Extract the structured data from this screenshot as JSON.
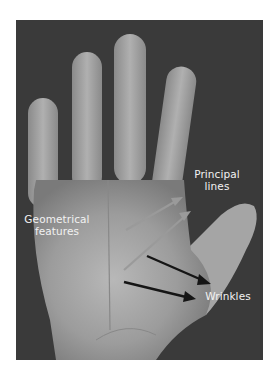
{
  "figure": {
    "background_color": "#3a3a3a",
    "labels": {
      "principal_lines": "Principal\nlines",
      "geometrical_features": "Geometrical\nfeatures",
      "wrinkles": "Wrinkles"
    },
    "arrow_colors": {
      "principal_lines": "#9a9a9a",
      "wrinkles": "#151515"
    }
  }
}
